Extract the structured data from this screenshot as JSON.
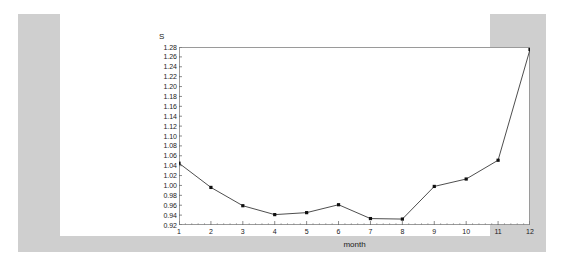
{
  "colors": {
    "page_background": "#ffffff",
    "band_background": "#cfcfcf",
    "card_background": "#ffffff",
    "frame": "#9a9a9a",
    "line": "#3a3a3a",
    "marker": "#101010",
    "tick": "#7a7a7a",
    "text": "#1a1a1a"
  },
  "chart_data": {
    "type": "line",
    "title": "",
    "xlabel": "month",
    "ylabel": "S",
    "x": [
      1,
      2,
      3,
      4,
      5,
      6,
      7,
      8,
      9,
      10,
      11,
      12
    ],
    "values": [
      1.045,
      0.996,
      0.959,
      0.941,
      0.945,
      0.961,
      0.933,
      0.932,
      0.998,
      1.013,
      1.051,
      1.275
    ],
    "categories": [
      "1",
      "2",
      "3",
      "4",
      "5",
      "6",
      "7",
      "8",
      "9",
      "10",
      "11",
      "12"
    ],
    "series": [
      {
        "name": "S",
        "values": [
          1.045,
          0.996,
          0.959,
          0.941,
          0.945,
          0.961,
          0.933,
          0.932,
          0.998,
          1.013,
          1.051,
          1.275
        ]
      }
    ],
    "xlim": [
      1,
      12
    ],
    "ylim": [
      0.92,
      1.28
    ],
    "ytick_step": 0.02,
    "xtick_step": 1,
    "x_minor_ticks_per_interval": 5,
    "grid": false,
    "legend": "none",
    "marker_style": "square",
    "ytick_labels": [
      "1.28",
      "1.26",
      "1.24",
      "1.22",
      "1.20",
      "1.18",
      "1.16",
      "1.14",
      "1.12",
      "1.10",
      "1.08",
      "1.06",
      "1.04",
      "1.02",
      "1.00",
      "0.98",
      "0.96",
      "0.94",
      "0.92"
    ],
    "xtick_labels": [
      "1",
      "2",
      "3",
      "4",
      "5",
      "6",
      "7",
      "8",
      "9",
      "10",
      "11",
      "12"
    ]
  }
}
